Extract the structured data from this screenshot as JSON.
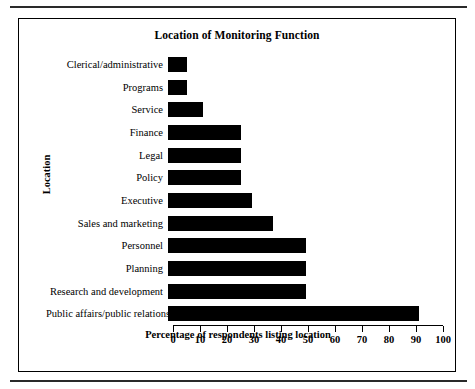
{
  "figure": {
    "title": "Location of Monitoring Function"
  },
  "chart_data": {
    "type": "bar",
    "orientation": "horizontal",
    "title": "Location of Monitoring Function",
    "xlabel": "Percentage of respondents listing location",
    "ylabel": "Location",
    "xlim": [
      0,
      100
    ],
    "xticks": [
      0,
      10,
      20,
      30,
      40,
      50,
      60,
      70,
      80,
      90,
      100
    ],
    "grid": false,
    "legend": null,
    "bar_color": "#000000",
    "categories": [
      "Clerical/administrative",
      "Programs",
      "Service",
      "Finance",
      "Legal",
      "Policy",
      "Executive",
      "Sales and marketing",
      "Personnel",
      "Planning",
      "Research and development",
      "Public affairs/public relations"
    ],
    "values": [
      7,
      7,
      13,
      27,
      27,
      27,
      31,
      39,
      51,
      51,
      51,
      93
    ]
  }
}
